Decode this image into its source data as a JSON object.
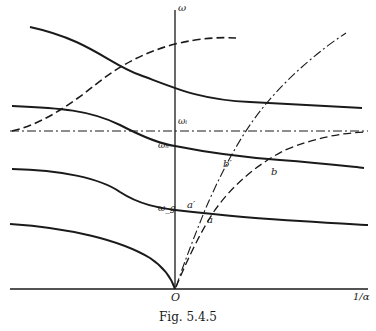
{
  "figure": {
    "caption": "Fig. 5.4.5",
    "axes": {
      "y_label": "ω",
      "x_label": "1/α",
      "origin_label": "O"
    },
    "levels": {
      "omega_i": "ωᵢ",
      "omega_h": "ωₕ",
      "omega_g": "ω_g"
    },
    "points": {
      "a": "a",
      "a_prime": "a′",
      "b": "b",
      "b_prime": "b′"
    },
    "colors": {
      "ink": "#1a1a1a",
      "background": "#ffffff"
    }
  }
}
